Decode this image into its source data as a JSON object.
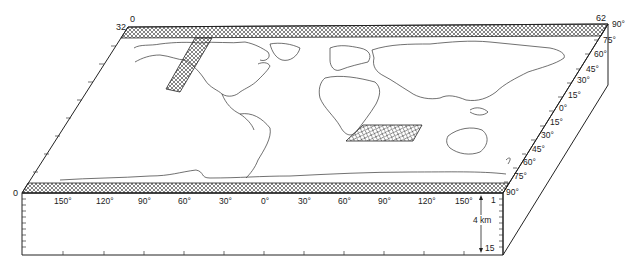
{
  "figure": {
    "type": "3d-block-world-map",
    "corner_labels": {
      "top_left_index": "32",
      "top_left_index_top": "0",
      "top_right_index": "62",
      "bottom_left_index": "0"
    },
    "longitude_labels": [
      "150°",
      "120°",
      "90°",
      "60°",
      "30°",
      "0°",
      "30°",
      "60°",
      "90°",
      "120°",
      "150°"
    ],
    "latitude_labels": [
      "90°",
      "75°",
      "60°",
      "45°",
      "30°",
      "15°",
      "0°",
      "15°",
      "30°",
      "45°",
      "60°",
      "75°",
      "90°"
    ],
    "depth_axis": {
      "top_label": "1",
      "mid_label": "4 km",
      "bottom_label": "15"
    },
    "hatched_regions": [
      "north-polar-band",
      "south-polar-band",
      "western-north-america-strip",
      "south-atlantic-patch"
    ],
    "colors": {
      "line": "#222222",
      "background": "#ffffff"
    }
  }
}
